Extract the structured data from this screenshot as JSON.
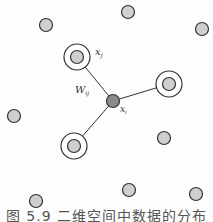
{
  "figure": {
    "caption": "图 5.9  二维空间中数据的分布",
    "colors": {
      "point_fill": "#cfcfcf",
      "center_fill": "#8a8a8a",
      "stroke": "#333333"
    },
    "labels": {
      "xj": "x",
      "xj_sub": "j",
      "xi": "x",
      "xi_sub": "i",
      "wij": "W",
      "wij_sub": "ij"
    },
    "center": {
      "x": 113,
      "y": 101,
      "r": 6.5
    },
    "neighbors": [
      {
        "x": 77,
        "y": 57,
        "r": 6.5,
        "ring": 13
      },
      {
        "x": 169,
        "y": 84,
        "r": 6.5,
        "ring": 13
      },
      {
        "x": 74,
        "y": 146,
        "r": 6.5,
        "ring": 13
      }
    ],
    "points": [
      {
        "x": 128,
        "y": 12
      },
      {
        "x": 46,
        "y": 25
      },
      {
        "x": 202,
        "y": 29
      },
      {
        "x": 14,
        "y": 116
      },
      {
        "x": 164,
        "y": 138
      },
      {
        "x": 129,
        "y": 190
      },
      {
        "x": 196,
        "y": 194
      },
      {
        "x": 36,
        "y": 201
      }
    ]
  }
}
